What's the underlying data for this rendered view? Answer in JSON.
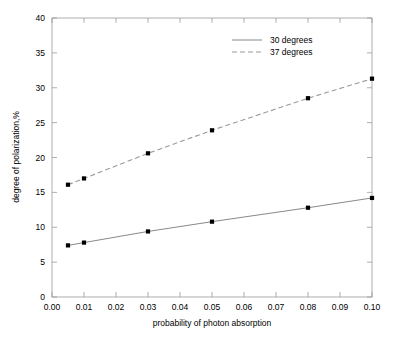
{
  "chart_data": {
    "type": "line",
    "title": "",
    "xlabel": "probability of photon absorption",
    "ylabel": "degree of polarization,%",
    "xlim": [
      0.0,
      0.1
    ],
    "ylim": [
      0,
      40
    ],
    "grid": false,
    "legend_position": "top-right",
    "x": [
      0.005,
      0.01,
      0.03,
      0.05,
      0.08,
      0.1
    ],
    "xticks": [
      "0.00",
      "0.01",
      "0.02",
      "0.03",
      "0.04",
      "0.05",
      "0.06",
      "0.07",
      "0.08",
      "0.09",
      "0.10"
    ],
    "xtick_values": [
      0.0,
      0.01,
      0.02,
      0.03,
      0.04,
      0.05,
      0.06,
      0.07,
      0.08,
      0.09,
      0.1
    ],
    "yticks": [
      "0",
      "5",
      "10",
      "15",
      "20",
      "25",
      "30",
      "35",
      "40"
    ],
    "ytick_values": [
      0,
      5,
      10,
      15,
      20,
      25,
      30,
      35,
      40
    ],
    "series": [
      {
        "name": "30 degrees",
        "style": "solid",
        "color": "#7a7a7a",
        "marker": "square",
        "values": [
          7.4,
          7.8,
          9.4,
          10.8,
          12.8,
          14.2
        ]
      },
      {
        "name": "37 degrees",
        "style": "dashed",
        "color": "#9a9a9a",
        "marker": "square",
        "values": [
          16.1,
          17.0,
          20.6,
          23.9,
          28.5,
          31.3
        ]
      }
    ]
  },
  "legend": {
    "items": [
      {
        "label": "30 degrees"
      },
      {
        "label": "37 degrees"
      }
    ]
  },
  "axes": {
    "x_title": "probability of photon absorption",
    "y_title": "degree of polarization,%"
  }
}
